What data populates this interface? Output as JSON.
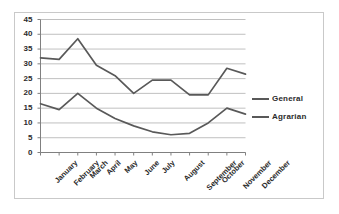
{
  "chart_data": {
    "type": "line",
    "title": "",
    "xlabel": "",
    "ylabel": "",
    "ylim": [
      0,
      45
    ],
    "ytick_step": 5,
    "yticks": [
      0,
      5,
      10,
      15,
      20,
      25,
      30,
      35,
      40,
      45
    ],
    "grid": "horizontal",
    "legend_position": "right",
    "categories": [
      "January",
      "February",
      "March",
      "April",
      "May",
      "June",
      "July",
      "August",
      "September",
      "October",
      "November",
      "December"
    ],
    "series": [
      {
        "name": "General",
        "color": "#595959",
        "values": [
          32,
          31.5,
          38.5,
          29.5,
          26,
          20,
          24.5,
          24.5,
          19.5,
          19.5,
          28.5,
          26.5
        ]
      },
      {
        "name": "Agrarian",
        "color": "#595959",
        "values": [
          16.5,
          14.5,
          20,
          15,
          11.5,
          9,
          7,
          6,
          6.5,
          10,
          15,
          13
        ]
      }
    ]
  },
  "colors": {
    "frame_border": "#c9c9c9",
    "gridline": "#b0b0b0",
    "axis": "#808080",
    "text": "#2b2b2b",
    "plot_background": "#ffffff"
  }
}
